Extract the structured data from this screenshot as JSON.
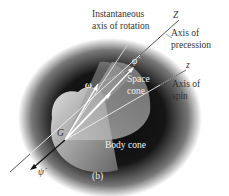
{
  "figure": {
    "panel_label": "(b)",
    "labels": {
      "instantaneous_axis": [
        "Instantaneous",
        "axis of rotation"
      ],
      "Z_axis": "Z",
      "axis_of_precession": [
        "Axis of",
        "precession"
      ],
      "z_axis": "z",
      "axis_of_spin": [
        "Axis of",
        "spin"
      ],
      "space_cone": [
        "Space",
        "cone"
      ],
      "body_cone": "Body cone",
      "omega": "ω",
      "phi_dot": "φ̇",
      "psi_dot": "ψ̇",
      "G": "G"
    },
    "colors": {
      "background_halo": "#111111",
      "line_light": "#f0f0f0",
      "line_dark": "#444444",
      "cone": "#bdbdbd"
    }
  }
}
